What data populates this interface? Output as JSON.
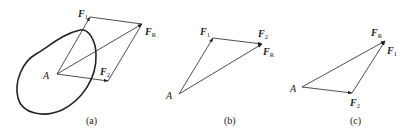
{
  "diagram": {
    "type": "vector-addition",
    "colors": {
      "stroke": "#222222",
      "background": "#ffffff"
    },
    "panels": [
      {
        "id": "a",
        "caption": "(a)",
        "description": "Parallelogram rule on a rigid body",
        "labels": {
          "point": "A",
          "f1": "F",
          "f1_sub": "1",
          "f2": "F",
          "f2_sub": "2",
          "fr": "F",
          "fr_sub": "R"
        }
      },
      {
        "id": "b",
        "caption": "(b)",
        "description": "Triangle rule: F1 then F2",
        "labels": {
          "point": "A",
          "f1": "F",
          "f1_sub": "1",
          "f2": "F",
          "f2_sub": "2",
          "fr": "F",
          "fr_sub": "R"
        }
      },
      {
        "id": "c",
        "caption": "(c)",
        "description": "Triangle rule: F2 then F1",
        "labels": {
          "point": "A",
          "f1": "F",
          "f1_sub": "1",
          "f2": "F",
          "f2_sub": "2",
          "fr": "F",
          "fr_sub": "R"
        }
      }
    ]
  }
}
